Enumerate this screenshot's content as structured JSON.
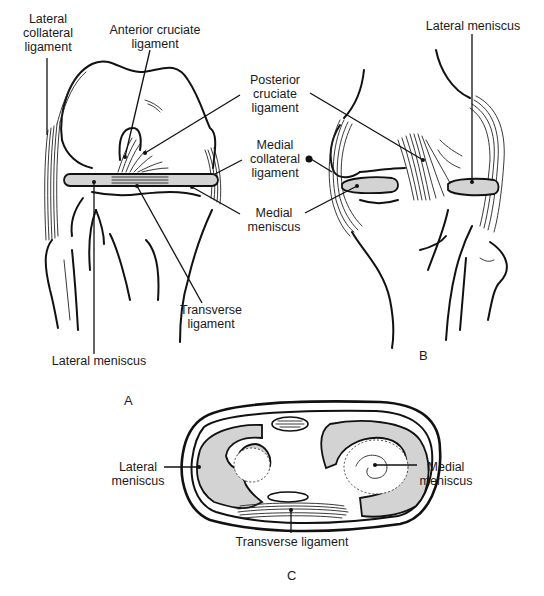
{
  "figure": {
    "panels": {
      "a": "A",
      "b": "B",
      "c": "C"
    },
    "labels": {
      "lateral_collateral_ligament": "Lateral\ncollateral\nligament",
      "anterior_cruciate_ligament": "Anterior cruciate\nligament",
      "posterior_cruciate_ligament": "Posterior\ncruciate\nligament",
      "medial_collateral_ligament": "Medial\ncollateral\nligament",
      "medial_meniscus_a": "Medial\nmeniscus",
      "transverse_ligament_a": "Transverse\nligament",
      "lateral_meniscus_a": "Lateral meniscus",
      "lateral_meniscus_b": "Lateral meniscus",
      "lateral_meniscus_c": "Lateral\nmeniscus",
      "medial_meniscus_c": "Medial\nmeniscus",
      "transverse_ligament_c": "Transverse ligament"
    },
    "colors": {
      "ink": "#111111",
      "meniscus_fill": "#d3d3d3",
      "background": "#ffffff"
    }
  }
}
